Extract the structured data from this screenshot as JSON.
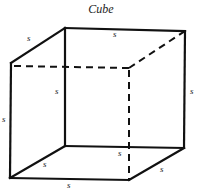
{
  "title": "Cube",
  "edge_label": "s",
  "colors": {
    "stroke": "#111111",
    "background": "#ffffff"
  },
  "diagram": {
    "type": "cube-oblique-projection",
    "vertices": {
      "back_top_left": [
        65,
        28
      ],
      "back_top_right": [
        185,
        31
      ],
      "front_top_left": [
        11,
        63
      ],
      "front_top_right": [
        129,
        68
      ],
      "back_bottom_left": [
        65,
        146
      ],
      "back_bottom_right": [
        184,
        148
      ],
      "front_bottom_left": [
        10,
        178
      ],
      "front_bottom_right": [
        129,
        180
      ]
    },
    "solid_edges": [
      [
        "front_top_left",
        "back_top_left"
      ],
      [
        "back_top_left",
        "back_top_right"
      ],
      [
        "back_top_left",
        "back_bottom_left"
      ],
      [
        "back_top_right",
        "back_bottom_right"
      ],
      [
        "front_top_left",
        "front_bottom_left"
      ],
      [
        "front_bottom_left",
        "front_bottom_right"
      ],
      [
        "front_bottom_left",
        "back_bottom_left"
      ],
      [
        "back_bottom_left",
        "back_bottom_right"
      ],
      [
        "front_bottom_right",
        "back_bottom_right"
      ]
    ],
    "dashed_edges": [
      [
        "front_top_left",
        "front_top_right"
      ],
      [
        "front_top_right",
        "back_top_right"
      ],
      [
        "front_top_right",
        "front_bottom_right"
      ]
    ],
    "labels": [
      {
        "text": "s",
        "x": 27,
        "y": 34
      },
      {
        "text": "s",
        "x": 113,
        "y": 30
      },
      {
        "text": "s",
        "x": 55,
        "y": 87
      },
      {
        "text": "s",
        "x": 190,
        "y": 87
      },
      {
        "text": "s",
        "x": 2,
        "y": 115
      },
      {
        "text": "s",
        "x": 118,
        "y": 149
      },
      {
        "text": "s",
        "x": 43,
        "y": 160
      },
      {
        "text": "s",
        "x": 160,
        "y": 165
      },
      {
        "text": "s",
        "x": 67,
        "y": 181
      }
    ]
  }
}
